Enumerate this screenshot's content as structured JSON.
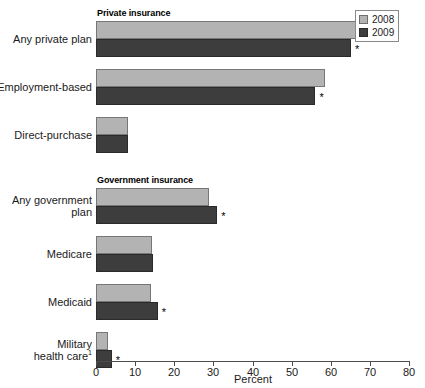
{
  "chart_data": {
    "type": "bar",
    "title": "",
    "subtitle": "",
    "xlabel": "Percent",
    "ylabel": "",
    "xlim": [
      0,
      80
    ],
    "xticks": [
      0,
      10,
      20,
      30,
      40,
      50,
      60,
      70,
      80
    ],
    "xticklabels": [
      "0",
      "10",
      "20",
      "30",
      "40",
      "50",
      "60",
      "70",
      "80"
    ],
    "grid": false,
    "orientation": "horizontal",
    "legend": {
      "position": "top-right",
      "entries": [
        {
          "name": "2008",
          "color": "#b3b3b3"
        },
        {
          "name": "2009",
          "color": "#3d3d3d"
        }
      ]
    },
    "series": [
      {
        "name": "2008",
        "color": "#b3b3b3",
        "values": [
          66.7,
          58.5,
          8.2,
          29.0,
          14.3,
          14.1,
          3.1,
          15.4
        ]
      },
      {
        "name": "2009",
        "color": "#3d3d3d",
        "values": [
          65.2,
          56.1,
          8.3,
          31.0,
          14.6,
          15.8,
          4.0,
          16.7
        ]
      }
    ],
    "categories": [
      "Any private plan",
      "Employment-based",
      "Direct-purchase",
      "Any government plan",
      "Medicare",
      "Medicaid",
      "Military health care",
      "Not covered"
    ],
    "groups": [
      {
        "header": "Private insurance",
        "categories": [
          {
            "label": "Any private plan",
            "label_lines": [
              "Any private plan"
            ],
            "footnote": "",
            "v2008": 66.7,
            "v2009": 65.2,
            "significant": true
          },
          {
            "label": "Employment-based",
            "label_lines": [
              "Employment-based"
            ],
            "footnote": "",
            "v2008": 58.5,
            "v2009": 56.1,
            "significant": true
          },
          {
            "label": "Direct-purchase",
            "label_lines": [
              "Direct-purchase"
            ],
            "footnote": "",
            "v2008": 8.2,
            "v2009": 8.3,
            "significant": false
          }
        ]
      },
      {
        "header": "Government insurance",
        "categories": [
          {
            "label": "Any government plan",
            "label_lines": [
              "Any government",
              "plan"
            ],
            "footnote": "",
            "v2008": 29.0,
            "v2009": 31.0,
            "significant": true
          },
          {
            "label": "Medicare",
            "label_lines": [
              "Medicare"
            ],
            "footnote": "",
            "v2008": 14.3,
            "v2009": 14.6,
            "significant": false
          },
          {
            "label": "Medicaid",
            "label_lines": [
              "Medicaid"
            ],
            "footnote": "",
            "v2008": 14.1,
            "v2009": 15.8,
            "significant": true
          },
          {
            "label": "Military health care",
            "label_lines": [
              "Military",
              "health care"
            ],
            "footnote": "1",
            "v2008": 3.1,
            "v2009": 4.0,
            "significant": true
          }
        ]
      },
      {
        "header": "No insurance",
        "categories": [
          {
            "label": "Not covered",
            "label_lines": [
              "Not covered"
            ],
            "footnote": "",
            "v2008": 15.4,
            "v2009": 16.7,
            "significant": true
          }
        ]
      }
    ],
    "significance_marker": "*"
  },
  "axis": {
    "title": "Percent"
  },
  "legend": {
    "entries": [
      {
        "label": "2008"
      },
      {
        "label": "2009"
      }
    ]
  }
}
